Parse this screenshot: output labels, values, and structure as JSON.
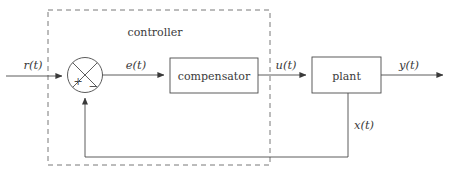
{
  "diagram": {
    "type": "control-system-block-diagram",
    "background_color": "#ffffff",
    "line_color": "#4a4a4a",
    "dashed_color": "#6a6a6a",
    "groups": [
      {
        "id": "controller-group",
        "label": "controller",
        "style": "dashed-rectangle",
        "contains": [
          "summing-junction",
          "compensator-block"
        ]
      }
    ],
    "blocks": [
      {
        "id": "compensator-block",
        "label": "compensator",
        "shape": "rectangle"
      },
      {
        "id": "plant-block",
        "label": "plant",
        "shape": "rectangle"
      },
      {
        "id": "summing-junction",
        "label": "",
        "shape": "circle-with-cross",
        "signs": {
          "positive": "+",
          "negative": "−"
        }
      }
    ],
    "signals": [
      {
        "id": "reference-signal",
        "label": "r(t)",
        "from": "input",
        "to": "summing-junction"
      },
      {
        "id": "error-signal",
        "label": "e(t)",
        "from": "summing-junction",
        "to": "compensator-block"
      },
      {
        "id": "control-signal",
        "label": "u(t)",
        "from": "compensator-block",
        "to": "plant-block"
      },
      {
        "id": "output-signal",
        "label": "y(t)",
        "from": "plant-block",
        "to": "output"
      },
      {
        "id": "feedback-signal",
        "label": "x(t)",
        "from": "plant-block",
        "to": "summing-junction"
      }
    ]
  }
}
